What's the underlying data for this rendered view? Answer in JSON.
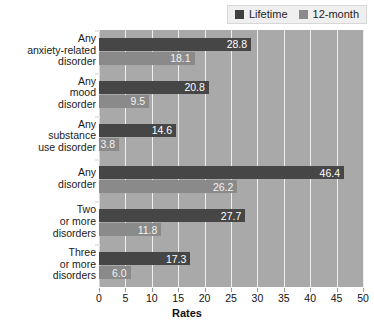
{
  "chart_data": {
    "type": "bar",
    "orientation": "horizontal",
    "title": "",
    "xlabel": "Rates",
    "ylabel": "",
    "xlim": [
      0,
      50
    ],
    "xticks": [
      0,
      5,
      10,
      15,
      20,
      25,
      30,
      35,
      40,
      45,
      50
    ],
    "grid": true,
    "legend_position": "top-right",
    "categories": [
      "Any\nanxiety-related\ndisorder",
      "Any\nmood\ndisorder",
      "Any\nsubstance\nuse disorder",
      "Any\ndisorder",
      "Two\nor more\ndisorders",
      "Three\nor more\ndisorders"
    ],
    "category_lines": [
      [
        "Any",
        "anxiety-related",
        "disorder"
      ],
      [
        "Any",
        "mood",
        "disorder"
      ],
      [
        "Any",
        "substance",
        "use disorder"
      ],
      [
        "Any",
        "disorder"
      ],
      [
        "Two",
        "or more",
        "disorders"
      ],
      [
        "Three",
        "or more",
        "disorders"
      ]
    ],
    "series": [
      {
        "name": "Lifetime",
        "color": "#464646",
        "values": [
          28.8,
          20.8,
          14.6,
          46.4,
          27.7,
          17.3
        ],
        "labels": [
          "28.8",
          "20.8",
          "14.6",
          "46.4",
          "27.7",
          "17.3"
        ]
      },
      {
        "name": "12-month",
        "color": "#8a8a8a",
        "values": [
          18.1,
          9.5,
          3.8,
          26.2,
          11.8,
          6.0
        ],
        "labels": [
          "18.1",
          "9.5",
          "3.8",
          "26.2",
          "11.8",
          "6.0"
        ]
      }
    ]
  },
  "legend": {
    "entries": [
      {
        "label": "Lifetime",
        "color": "#3f3f3f"
      },
      {
        "label": "12-month",
        "color": "#8a8a8a"
      }
    ]
  },
  "axis": {
    "x_title": "Rates",
    "tick_labels": [
      "0",
      "5",
      "10",
      "15",
      "20",
      "25",
      "30",
      "35",
      "40",
      "45",
      "50"
    ]
  },
  "colors": {
    "plot_background": "#a9a9a9",
    "gridline": "#efefef",
    "lifetime_bar": "#464646",
    "twelve_month_bar": "#8a8a8a",
    "page_background": "#ffffff",
    "text": "#1a1a1a"
  }
}
